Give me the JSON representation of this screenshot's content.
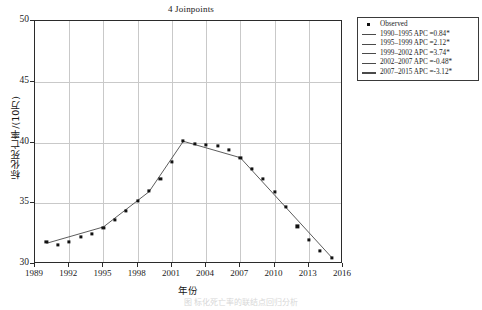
{
  "chart_title": "4 Joinpoints",
  "axis": {
    "ylabel": "标化死亡率/(10万)",
    "xlabel": "年份",
    "yticks": [
      30,
      35,
      40,
      45,
      50
    ],
    "xticks": [
      1989,
      1992,
      1995,
      1998,
      2001,
      2004,
      2007,
      2010,
      2013,
      2016
    ]
  },
  "legend": {
    "items": [
      {
        "marker": "square",
        "label": "Observed"
      },
      {
        "marker": "line",
        "label": "1990–1995 APC =0.84*"
      },
      {
        "marker": "line",
        "label": "1995–1999 APC =2.12*"
      },
      {
        "marker": "line",
        "label": "1999–2002 APC =3.74*"
      },
      {
        "marker": "line",
        "label": "2002–2007 APC =-0.48*"
      },
      {
        "marker": "line",
        "label": "2007–2015 APC =-3.12*"
      }
    ]
  },
  "caption": "图  标化死亡率的联结点回归分析",
  "colors": {
    "marker": "#111111",
    "fitline": "#4a4a4a",
    "grid": "#c9c9c9",
    "frame": "#2b2b2b"
  },
  "chart_data": {
    "type": "scatter",
    "title": "4 Joinpoints",
    "xlabel": "年份",
    "ylabel": "标化死亡率/(10万)",
    "xlim": [
      1989,
      2016
    ],
    "ylim": [
      30,
      50
    ],
    "grid": true,
    "legend_position": "outside-top-right",
    "x": [
      1990,
      1991,
      1992,
      1993,
      1994,
      1995,
      1996,
      1997,
      1998,
      1999,
      2000,
      2001,
      2002,
      2003,
      2004,
      2005,
      2006,
      2007,
      2008,
      2009,
      2010,
      2011,
      2012,
      2013,
      2014,
      2015
    ],
    "series": [
      {
        "name": "Observed",
        "values": [
          31.8,
          31.6,
          31.8,
          32.2,
          32.5,
          33.0,
          33.6,
          34.4,
          35.2,
          36.0,
          37.0,
          38.4,
          40.1,
          39.9,
          39.8,
          39.7,
          39.4,
          38.7,
          37.8,
          37.0,
          35.9,
          34.7,
          33.1,
          32.0,
          31.1,
          30.5
        ]
      }
    ],
    "joinpoints": [
      1995,
      1999,
      2002,
      2007
    ],
    "segments": [
      {
        "range": "1990–1995",
        "apc": 0.84,
        "significant": true,
        "x0": 1990,
        "x1": 1995,
        "y0": 31.7,
        "y1": 33.05
      },
      {
        "range": "1995–1999",
        "apc": 2.12,
        "significant": true,
        "x0": 1995,
        "x1": 1999,
        "y0": 33.05,
        "y1": 35.95
      },
      {
        "range": "1999–2002",
        "apc": 3.74,
        "significant": true,
        "x0": 1999,
        "x1": 2002,
        "y0": 35.95,
        "y1": 40.1
      },
      {
        "range": "2002–2007",
        "apc": -0.48,
        "significant": true,
        "x0": 2002,
        "x1": 2007,
        "y0": 40.1,
        "y1": 38.75
      },
      {
        "range": "2007–2015",
        "apc": -3.12,
        "significant": true,
        "x0": 2007,
        "x1": 2015,
        "y0": 38.75,
        "y1": 30.55
      }
    ]
  }
}
